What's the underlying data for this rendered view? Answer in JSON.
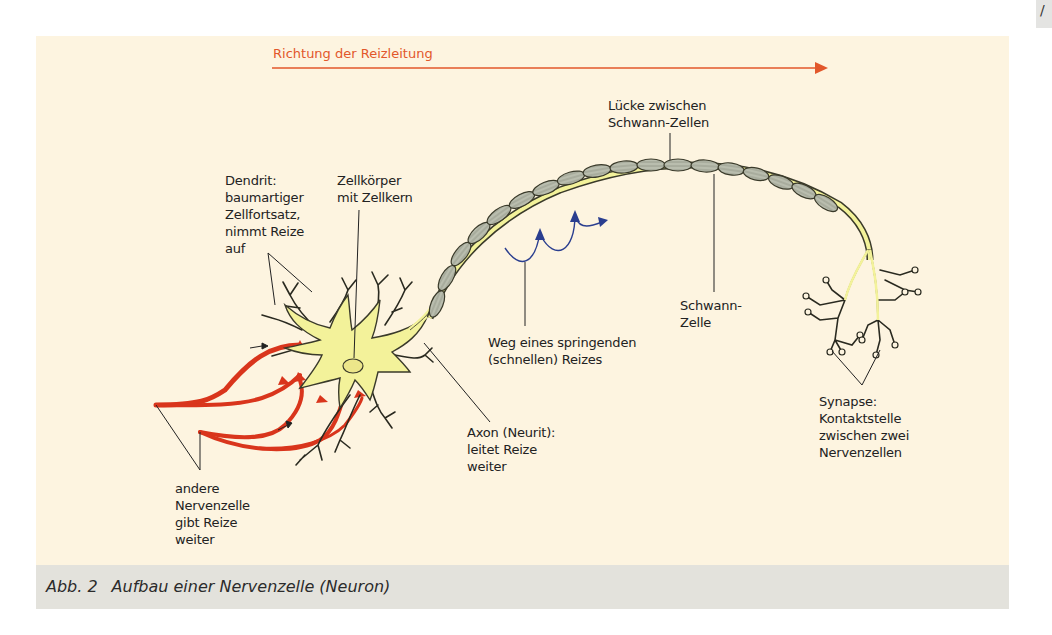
{
  "figure": {
    "direction_label": "Richtung der Reizleitung",
    "caption_number": "Abb. 2",
    "caption_text": "Aufbau einer Nervenzelle (Neuron)",
    "corner_tab_glyph": "/"
  },
  "labels": {
    "dendrit": "Dendrit:\nbaumartiger\nZellfortsatz,\nnimmt Reize\nauf",
    "zellkoerper": "Zellkörper\nmit Zellkern",
    "luecke": "Lücke zwischen\nSchwann-Zellen",
    "weg": "Weg eines springenden\n(schnellen) Reizes",
    "schwann": "Schwann-\nZelle",
    "axon": "Axon (Neurit):\nleitet Reize\nweiter",
    "synapse": "Synapse:\nKontaktstelle\nzwischen zwei\nNervenzellen",
    "andere": "andere\nNervenzelle\ngibt Reize\nweiter"
  },
  "colors": {
    "panel_bg": "#fdf4e0",
    "caption_bg": "#e3e2dc",
    "arrow": "#e2572b",
    "cell_body": "#f3f29a",
    "cell_outline": "#3a3a2a",
    "schwann_fill": "#b9bdae",
    "incoming_nerve": "#d9351c",
    "saltatory_arrows": "#2a3e8f"
  }
}
